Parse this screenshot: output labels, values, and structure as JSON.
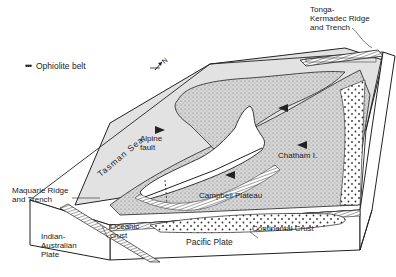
{
  "legend": {
    "symbol": "•••",
    "label": "Ophiolite belt"
  },
  "labels": {
    "tonga": "Tonga-\nKermadec Ridge\nand Trench",
    "tasman_sea": "Tasman Sea",
    "alpine_fault": "Alpine\nfault",
    "chatham": "Chatham I.",
    "campbell_plateau": "Campbell Plateau",
    "macquarie": "Maquarie Ridge\nand Trench",
    "indian_australian": "Indian-\nAustralian\nPlate",
    "oceanic_crust": "Oceanic\ncrust",
    "pacific_plate": "Pacific Plate",
    "continental_crust": "Continental Crust"
  },
  "compass": {
    "label": "N"
  },
  "colors": {
    "ink": "#222222",
    "sea": "#d9d9d9",
    "stipple_bg": "#bdbdbd",
    "paper": "#ffffff"
  }
}
